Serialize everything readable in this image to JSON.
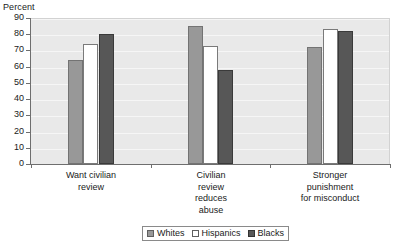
{
  "chart_data": {
    "type": "bar",
    "title": "",
    "subtitle": "",
    "xlabel": "",
    "ylabel": "Percent",
    "ylim": [
      0,
      90
    ],
    "ytick_step": 10,
    "yticks": [
      "90",
      "80",
      "70",
      "60",
      "50",
      "40",
      "30",
      "20",
      "10",
      "0"
    ],
    "grid": true,
    "legend_position": "bottom",
    "categories": [
      "Want civilian\nreview",
      "Civilian\nreview\nreduces\nabuse",
      "Stronger\npunishment\nfor misconduct"
    ],
    "series": [
      {
        "name": "Whites",
        "color": "#989898",
        "values": [
          64,
          85,
          72
        ]
      },
      {
        "name": "Hispanics",
        "color": "#ffffff",
        "values": [
          74,
          73,
          83
        ]
      },
      {
        "name": "Blacks",
        "color": "#575757",
        "values": [
          80,
          58,
          82
        ]
      }
    ]
  },
  "legend": {
    "entries": [
      "Whites",
      "Hispanics",
      "Blacks"
    ]
  },
  "colors": {
    "plot_background": "#e9e9e9",
    "gridline": "#f6f6f6",
    "axis": "#6e6e6e",
    "text": "#1a1a1a",
    "page_background": "#ffffff"
  }
}
